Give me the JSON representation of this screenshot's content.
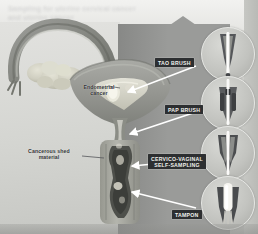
{
  "figure": {
    "ghost_caption_text": "Sampling for uterine cervical cancer\nand uterine cancer",
    "background_color": "#c9cac6",
    "wedge_color": "#9a9b99",
    "label_box_color": "#2d2f31",
    "label_text_color": "#f2f2ee",
    "arrow_color": "#ffffff"
  },
  "anatomy": {
    "labels": [
      {
        "id": "endometrial-cancer",
        "text": "Endometrial\ncancer",
        "x": 76,
        "y": 84,
        "width": 46
      },
      {
        "id": "cancerous-shed-material",
        "text": "Cancerous shed\nmaterial",
        "x": 18,
        "y": 148,
        "width": 62
      }
    ],
    "parts": [
      {
        "id": "fallopian-tube",
        "name": "Fallopian tube"
      },
      {
        "id": "ovary",
        "name": "Ovary"
      },
      {
        "id": "uterus-body",
        "name": "Uterus body"
      },
      {
        "id": "endometrial-cavity",
        "name": "Endometrial cavity"
      },
      {
        "id": "cervix",
        "name": "Cervix"
      },
      {
        "id": "vaginal-canal",
        "name": "Vaginal canal"
      }
    ]
  },
  "devices": [
    {
      "id": "tao-brush",
      "label": "TAO BRUSH",
      "label_x": 155,
      "label_y": 58,
      "circle_x": 201,
      "circle_y": 27,
      "circle_size": 52
    },
    {
      "id": "pap-brush",
      "label": "PAP BRUSH",
      "label_x": 165,
      "label_y": 105,
      "circle_x": 201,
      "circle_y": 76,
      "circle_size": 52
    },
    {
      "id": "cervico-vaginal-self-sampling",
      "label": "CERVICO-VAGINAL\nSELF-SAMPLING",
      "label_x": 148,
      "label_y": 154,
      "circle_x": 201,
      "circle_y": 126,
      "circle_size": 52
    },
    {
      "id": "tampon",
      "label": "TAMPON",
      "label_x": 172,
      "label_y": 210,
      "circle_x": 201,
      "circle_y": 176,
      "circle_size": 52
    }
  ]
}
